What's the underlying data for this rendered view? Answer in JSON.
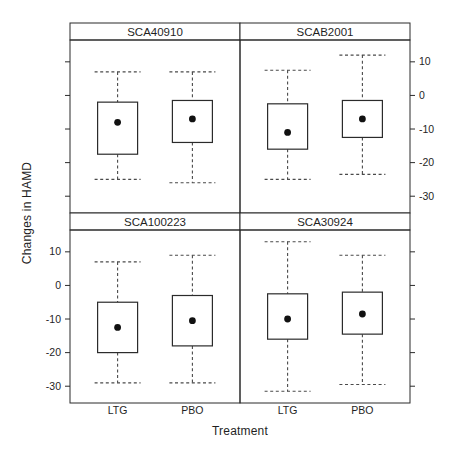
{
  "figure": {
    "background": "#ffffff",
    "line_color": "#2b2b2b",
    "dash_color": "#4a4a4a",
    "text_color": "#1f1f1f",
    "strip_fill": "#ffffff"
  },
  "chart_data": {
    "type": "boxplot",
    "title": "",
    "xlabel": "Treatment",
    "ylabel": "Changes in HAMD",
    "ylim": [
      -35,
      16.5
    ],
    "yticks": [
      10,
      0,
      -10,
      -20,
      -30
    ],
    "ytick_labels": [
      "10",
      "0",
      "-10",
      "-20",
      "-30"
    ],
    "categories": [
      "LTG",
      "PBO"
    ],
    "legend": "none",
    "grid": "off",
    "panels": [
      {
        "label": "SCA40910",
        "row": 0,
        "col": 0,
        "boxes": [
          {
            "treatment": "LTG",
            "whisker_low": -25,
            "q1": -17.5,
            "median": -8,
            "q3": -2,
            "whisker_high": 7
          },
          {
            "treatment": "PBO",
            "whisker_low": -26,
            "q1": -14,
            "median": -7,
            "q3": -1.5,
            "whisker_high": 7
          }
        ]
      },
      {
        "label": "SCAB2001",
        "row": 0,
        "col": 1,
        "boxes": [
          {
            "treatment": "LTG",
            "whisker_low": -25,
            "q1": -16,
            "median": -11,
            "q3": -2.5,
            "whisker_high": 7.5
          },
          {
            "treatment": "PBO",
            "whisker_low": -23.5,
            "q1": -12.5,
            "median": -7,
            "q3": -1.5,
            "whisker_high": 12
          }
        ]
      },
      {
        "label": "SCA100223",
        "row": 1,
        "col": 0,
        "boxes": [
          {
            "treatment": "LTG",
            "whisker_low": -29,
            "q1": -20,
            "median": -12.5,
            "q3": -5,
            "whisker_high": 7
          },
          {
            "treatment": "PBO",
            "whisker_low": -29,
            "q1": -18,
            "median": -10.5,
            "q3": -3,
            "whisker_high": 9
          }
        ]
      },
      {
        "label": "SCA30924",
        "row": 1,
        "col": 1,
        "boxes": [
          {
            "treatment": "LTG",
            "whisker_low": -31.5,
            "q1": -16,
            "median": -10,
            "q3": -2.5,
            "whisker_high": 13
          },
          {
            "treatment": "PBO",
            "whisker_low": -29.5,
            "q1": -14.5,
            "median": -8.5,
            "q3": -2,
            "whisker_high": 9
          }
        ]
      }
    ]
  }
}
